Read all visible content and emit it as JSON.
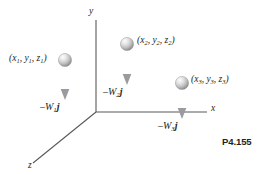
{
  "figure": {
    "problem_number": "P4.155",
    "axes": {
      "y_label": "y",
      "x_label": "x",
      "z_label": "z",
      "origin": [
        96,
        112
      ],
      "axis_color": "#58595b"
    },
    "masses": [
      {
        "id": "mass-1",
        "coord_label": "(x",
        "coord_sub1": "1",
        "coord_mid1": ", y",
        "coord_sub2": "1",
        "coord_mid2": ", z",
        "coord_sub3": "1",
        "coord_end": ")",
        "force_minus": "–W",
        "force_sub": "1",
        "force_vec": "j",
        "sphere_center": [
          65,
          60
        ],
        "sphere_radius": 6.5,
        "arrow_tip_y": 99
      },
      {
        "id": "mass-2",
        "coord_label": "(x",
        "coord_sub1": "2",
        "coord_mid1": ", y",
        "coord_sub2": "2",
        "coord_mid2": ", z",
        "coord_sub3": "2",
        "coord_end": ")",
        "force_minus": "–W",
        "force_sub": "2",
        "force_vec": "j",
        "sphere_center": [
          127,
          44
        ],
        "sphere_radius": 6.5,
        "arrow_tip_y": 84
      },
      {
        "id": "mass-3",
        "coord_label": "(x",
        "coord_sub1": "3",
        "coord_mid1": ", y",
        "coord_sub2": "3",
        "coord_mid2": ", z",
        "coord_sub3": "3",
        "coord_end": ")",
        "force_minus": "–W",
        "force_sub": "3",
        "force_vec": "j",
        "sphere_center": [
          182,
          83
        ],
        "sphere_radius": 6.5,
        "arrow_tip_y": 118
      }
    ],
    "colors": {
      "line": "#58595b",
      "text": "#231f20",
      "sphere_light": "#f2f2f2",
      "sphere_mid": "#c8c8c8",
      "sphere_dark": "#8c8c8c",
      "arrow": "#939598",
      "background": "#ffffff"
    }
  }
}
